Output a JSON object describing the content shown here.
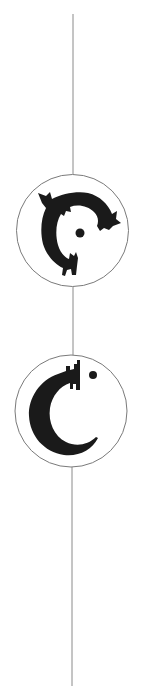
{
  "figure": {
    "line_color": "#8a8a8a",
    "circle_stroke": "#7a7a7a",
    "glyph_color": "#1a1a1a",
    "background": "#ffffff",
    "medallions": [
      {
        "label": "creature-crescent-medallion"
      },
      {
        "label": "c-crescent-medallion"
      }
    ]
  }
}
